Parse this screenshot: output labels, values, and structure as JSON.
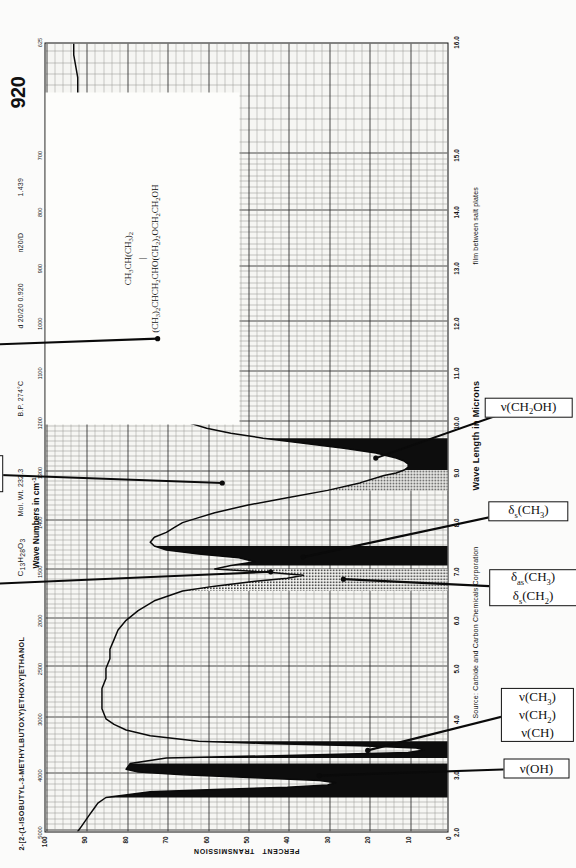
{
  "sheet": {
    "spectrum_number": "920",
    "compound_name": "2-[2-(1-ISOBUTYL-3-METHYLBUTOXY)ETHOXY]ETHANOL",
    "formula": "C13H28O3",
    "mol_wt": "Mol. Wt. 232.3",
    "bp": "B.P. 274°C",
    "density": "d 20/20  0.920",
    "refractive_index_label": "n20/D",
    "refractive_index": "1.439",
    "wavenumber_axis_title": "Wave Numbers in cm",
    "wavenumber_axis_exponent": "-1",
    "wavelength_axis_title": "Wave Length in Microns",
    "yaxis_title_line1": "PERCENT",
    "yaxis_title_line2": "TRANSMISSION",
    "source": "Source: Carbide and Carbon Chemicals Corporation",
    "sample_state": "film between salt plates",
    "structure_line1": "CH3CH(CH3)2",
    "structure_bond": "|",
    "structure_line2": "(CH3)2CHCH2CHO(CH2)2OCH2CH2OH"
  },
  "chart_data": {
    "type": "line",
    "xlabel": "Wave Length in Microns",
    "x2label": "Wave Numbers in cm-1",
    "ylabel": "PERCENT TRANSMISSION",
    "xlim": [
      2.0,
      16.0
    ],
    "ylim": [
      0,
      100
    ],
    "grid": true,
    "legend": "none",
    "x_ticks_microns": [
      "2.0",
      "3.0",
      "4.0",
      "5.0",
      "6.0",
      "7.0",
      "8.0",
      "9.0",
      "10.0",
      "11.0",
      "12.0",
      "13.0",
      "14.0",
      "15.0",
      "16.0"
    ],
    "x_ticks_wavenumber": [
      "5000",
      "4000",
      "3000",
      "2500",
      "2000",
      "1500",
      "1400",
      "1300",
      "1200",
      "1100",
      "1000",
      "900",
      "800",
      "700",
      "625"
    ],
    "y_ticks": [
      "0",
      "10",
      "20",
      "30",
      "40",
      "50",
      "60",
      "70",
      "80",
      "90",
      "100"
    ],
    "x": [
      2.0,
      2.1,
      2.2,
      2.3,
      2.4,
      2.5,
      2.6,
      2.7,
      2.74,
      2.78,
      2.82,
      2.86,
      2.9,
      2.95,
      3.0,
      3.05,
      3.1,
      3.2,
      3.3,
      3.36,
      3.4,
      3.44,
      3.48,
      3.52,
      3.56,
      3.6,
      3.7,
      3.8,
      3.9,
      4.0,
      4.2,
      4.4,
      4.6,
      4.8,
      5.0,
      5.2,
      5.4,
      5.6,
      5.8,
      6.0,
      6.2,
      6.4,
      6.6,
      6.7,
      6.8,
      6.86,
      6.92,
      6.98,
      7.05,
      7.12,
      7.2,
      7.28,
      7.36,
      7.44,
      7.52,
      7.6,
      7.7,
      7.8,
      7.9,
      8.0,
      8.1,
      8.2,
      8.35,
      8.5,
      8.65,
      8.8,
      8.95,
      9.0,
      9.06,
      9.12,
      9.18,
      9.24,
      9.3,
      9.4,
      9.5,
      9.6,
      9.7,
      9.8,
      9.9,
      10.0,
      10.2,
      10.4,
      10.6,
      10.8,
      11.0,
      11.2,
      11.4,
      11.55,
      11.65,
      11.75,
      11.85,
      11.95,
      12.1,
      12.3,
      12.5,
      12.7,
      12.9,
      13.1,
      13.3,
      13.5,
      13.7,
      13.9,
      14.1,
      14.3,
      14.5,
      14.7,
      14.9,
      15.1,
      15.3,
      15.5,
      15.7,
      15.9,
      16.0
    ],
    "y": [
      92,
      91,
      90,
      89,
      88,
      87,
      85,
      74,
      58,
      40,
      30,
      28,
      32,
      48,
      66,
      77,
      80,
      79,
      70,
      30,
      10,
      6,
      8,
      22,
      46,
      62,
      74,
      80,
      83,
      85,
      86,
      86,
      86,
      85,
      85,
      84,
      84,
      83,
      82,
      80,
      77,
      73,
      66,
      58,
      48,
      40,
      36,
      44,
      58,
      54,
      48,
      52,
      62,
      70,
      73,
      74,
      73,
      70,
      68,
      66,
      62,
      58,
      50,
      40,
      30,
      22,
      16,
      13,
      11,
      10,
      10,
      11,
      13,
      18,
      26,
      36,
      46,
      54,
      60,
      64,
      70,
      74,
      77,
      79,
      80,
      80,
      79,
      74,
      66,
      76,
      72,
      66,
      78,
      82,
      84,
      85,
      86,
      86,
      87,
      87,
      88,
      88,
      88,
      89,
      89,
      90,
      90,
      91,
      91,
      92,
      92,
      93,
      93
    ],
    "fill_bands": [
      {
        "from": 2.6,
        "to": 3.25,
        "style": "solid-dark",
        "note": "nu(OH) broad band"
      },
      {
        "from": 3.28,
        "to": 3.62,
        "style": "solid-dark",
        "note": "nu(CH3) nu(CH2) nu(CH)"
      },
      {
        "from": 6.6,
        "to": 7.1,
        "style": "hatched",
        "note": "delta-as(CH3) delta-s(CH2)"
      },
      {
        "from": 7.1,
        "to": 7.55,
        "style": "solid-dark",
        "note": "delta-s(CH3)"
      },
      {
        "from": 8.55,
        "to": 9.05,
        "style": "hatched",
        "note": "nu(CH2O)? nu(CHRO)?"
      },
      {
        "from": 9.05,
        "to": 9.75,
        "style": "solid-dark",
        "note": "nu(CH2OH)"
      }
    ],
    "annotations": [
      {
        "id": "nu-OH",
        "lines": [
          "ν(OH)"
        ],
        "target_microns": 3.0
      },
      {
        "id": "nu-CH",
        "lines": [
          "ν(CH3)",
          "ν(CH2)",
          "ν(CH)"
        ],
        "target_microns": 3.45
      },
      {
        "id": "delta-as-CH",
        "lines": [
          "δas(CH3)",
          "δs(CH2)"
        ],
        "target_microns": 6.85
      },
      {
        "id": "beta-OH",
        "lines": [
          "β(OH)"
        ],
        "target_microns": 7.0
      },
      {
        "id": "delta-s-CH3",
        "lines": [
          "δs(CH3)"
        ],
        "target_microns": 7.3
      },
      {
        "id": "nu-CH2O",
        "lines": [
          "ν(CH2O)?",
          "ν(CHRO)?"
        ],
        "target_microns": 8.8
      },
      {
        "id": "nu-CH2OH",
        "lines": [
          "ν(CH2OH)"
        ],
        "target_microns": 9.3
      },
      {
        "id": "question",
        "lines": [
          "?"
        ],
        "target_microns": 11.7
      }
    ]
  },
  "annotation_boxes": {
    "nu_oh": "ν(OH)",
    "nu_ch3": "ν(CH3)",
    "nu_ch2": "ν(CH2)",
    "nu_ch": "ν(CH)",
    "delta_as_ch3": "δas(CH3)",
    "delta_s_ch2": "δs(CH2)",
    "beta_oh": "β(OH)",
    "delta_s_ch3": "δs(CH3)",
    "nu_ch2o_q": "ν(CH2O)?",
    "nu_chro_q": "ν(CHRO)?",
    "nu_ch2oh": "ν(CH2OH)",
    "question": "?"
  }
}
